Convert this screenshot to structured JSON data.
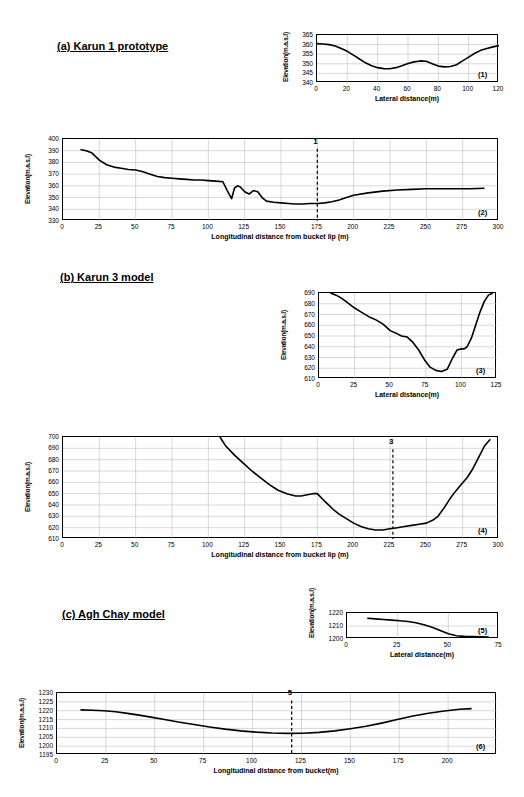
{
  "sections": [
    {
      "label": "(a) Karun 1 prototype"
    },
    {
      "label": "(b) Karun 3 model"
    },
    {
      "label": "(c) Agh Chay model"
    }
  ],
  "chart_data": [
    {
      "id": "(1)",
      "type": "line",
      "title": "",
      "xlabel": "Lateral distance(m)",
      "ylabel": "Elevation(m.a.s.l)",
      "xlim": [
        0,
        120
      ],
      "ylim": [
        340,
        365
      ],
      "xticks": [
        0,
        20,
        40,
        60,
        80,
        100,
        120
      ],
      "yticks": [
        340,
        345,
        350,
        355,
        360,
        365
      ],
      "grid": true,
      "x": [
        0,
        4,
        8,
        12,
        16,
        20,
        24,
        28,
        32,
        36,
        40,
        44,
        48,
        52,
        56,
        60,
        64,
        68,
        72,
        76,
        80,
        84,
        88,
        92,
        96,
        100,
        104,
        108,
        112,
        116,
        120
      ],
      "y": [
        360.5,
        360.3,
        360.0,
        359.3,
        358.0,
        356.5,
        354.5,
        352.5,
        350.5,
        349.0,
        348.0,
        347.5,
        347.4,
        348.0,
        349.0,
        350.2,
        351.0,
        351.5,
        351.3,
        350.0,
        348.8,
        348.4,
        348.6,
        349.5,
        351.5,
        353.5,
        355.5,
        357.0,
        358.0,
        358.8,
        359.5
      ]
    },
    {
      "id": "(2)",
      "type": "line",
      "title": "",
      "xlabel": "Longitudinal distance from bucket lip (m)",
      "ylabel": "Elevation(m.a.s.l)",
      "xlim": [
        0,
        300
      ],
      "ylim": [
        330,
        400
      ],
      "xticks": [
        0,
        25,
        50,
        75,
        100,
        125,
        150,
        175,
        200,
        225,
        250,
        275,
        300
      ],
      "yticks": [
        330,
        340,
        350,
        360,
        370,
        380,
        390,
        400
      ],
      "grid": true,
      "annotation": {
        "label": "1",
        "x": 175
      },
      "x": [
        12,
        16,
        20,
        25,
        30,
        35,
        40,
        45,
        50,
        55,
        60,
        65,
        70,
        75,
        80,
        85,
        90,
        95,
        100,
        105,
        110,
        113,
        116,
        118,
        120,
        122,
        125,
        128,
        131,
        134,
        137,
        140,
        145,
        150,
        155,
        160,
        165,
        170,
        175,
        180,
        185,
        190,
        195,
        200,
        210,
        220,
        230,
        240,
        250,
        260,
        270,
        280,
        290
      ],
      "y": [
        391,
        390,
        388,
        382,
        378,
        376,
        375,
        374,
        373.5,
        372,
        370,
        368,
        367,
        366.5,
        366,
        365.5,
        365,
        365,
        364.5,
        364,
        363.5,
        356,
        349,
        358,
        360,
        359,
        355,
        353,
        356,
        355,
        350,
        347,
        346,
        345.5,
        345,
        344.5,
        344.5,
        345,
        345,
        345.5,
        346.5,
        348,
        350,
        352,
        354,
        355.5,
        356.5,
        357,
        357.5,
        357.5,
        357.5,
        357.5,
        358
      ]
    },
    {
      "id": "(3)",
      "type": "line",
      "title": "",
      "xlabel": "Lateral distance(m)",
      "ylabel": "Elevation(m.a.s.l)",
      "xlim": [
        0,
        125
      ],
      "ylim": [
        610,
        690
      ],
      "xticks": [
        0,
        25,
        50,
        75,
        100,
        125
      ],
      "yticks": [
        610,
        620,
        630,
        640,
        650,
        660,
        670,
        680,
        690
      ],
      "grid": true,
      "x": [
        8,
        12,
        16,
        20,
        25,
        30,
        35,
        40,
        45,
        50,
        55,
        58,
        62,
        66,
        70,
        74,
        78,
        82,
        86,
        90,
        94,
        97,
        100,
        102,
        104,
        107,
        110,
        113,
        116,
        119,
        122
      ],
      "y": [
        690,
        688,
        685,
        681,
        676,
        672,
        668,
        665,
        661,
        655,
        652,
        650,
        649,
        644,
        637,
        628,
        621,
        618,
        617,
        619,
        630,
        637,
        638,
        638,
        640,
        648,
        660,
        672,
        682,
        688,
        690
      ]
    },
    {
      "id": "(4)",
      "type": "line",
      "title": "",
      "xlabel": "Longitudinal distance from bucket lip (m)",
      "ylabel": "Elevation(m.a.s.l)",
      "xlim": [
        0,
        300
      ],
      "ylim": [
        610,
        700
      ],
      "xticks": [
        0,
        25,
        50,
        75,
        100,
        125,
        150,
        175,
        200,
        225,
        250,
        275,
        300
      ],
      "yticks": [
        610,
        620,
        630,
        640,
        650,
        660,
        670,
        680,
        690,
        700
      ],
      "grid": true,
      "annotation": {
        "label": "3",
        "x": 227
      },
      "x": [
        108,
        112,
        118,
        124,
        130,
        136,
        142,
        148,
        154,
        160,
        164,
        168,
        172,
        175,
        178,
        182,
        186,
        190,
        195,
        200,
        205,
        210,
        215,
        220,
        225,
        230,
        235,
        240,
        245,
        250,
        255,
        258,
        262,
        266,
        270,
        274,
        278,
        282,
        286,
        290,
        294
      ],
      "y": [
        700,
        692,
        684,
        677,
        670,
        664,
        658,
        653,
        650,
        648,
        648,
        649,
        650,
        650,
        646,
        641,
        636,
        632,
        628,
        624,
        621,
        619,
        618,
        618,
        619,
        620,
        621,
        622,
        623,
        624,
        627,
        630,
        637,
        645,
        652,
        658,
        664,
        672,
        682,
        692,
        698
      ]
    },
    {
      "id": "(5)",
      "type": "line",
      "title": "",
      "xlabel": "Lateral distance(m)",
      "ylabel": "Elevation(m.a.s.l)",
      "xlim": [
        0,
        75
      ],
      "ylim": [
        1200,
        1220
      ],
      "xticks": [
        0,
        25,
        50,
        75
      ],
      "yticks": [
        1200,
        1210,
        1220
      ],
      "grid": true,
      "x": [
        10,
        14,
        18,
        22,
        26,
        30,
        34,
        38,
        42,
        46,
        50,
        54,
        58,
        62,
        66,
        70
      ],
      "y": [
        1216,
        1215.5,
        1215,
        1214.5,
        1214,
        1213.5,
        1212.5,
        1211,
        1209,
        1206.5,
        1204,
        1202.5,
        1202,
        1201.8,
        1201.7,
        1201.5
      ]
    },
    {
      "id": "(6)",
      "type": "line",
      "title": "",
      "xlabel": "Longitudinal distance from bucket(m)",
      "ylabel": "Elevation(m.a.s.l)",
      "xlim": [
        0,
        225
      ],
      "ylim": [
        1195,
        1230
      ],
      "xticks": [
        0,
        25,
        50,
        75,
        100,
        125,
        150,
        175,
        200
      ],
      "yticks": [
        1195,
        1200,
        1205,
        1210,
        1215,
        1220,
        1225,
        1230
      ],
      "grid": true,
      "annotation": {
        "label": "5",
        "x": 120
      },
      "x": [
        12,
        18,
        24,
        30,
        36,
        42,
        48,
        55,
        62,
        70,
        78,
        86,
        94,
        102,
        110,
        118,
        126,
        134,
        142,
        150,
        158,
        166,
        174,
        182,
        190,
        198,
        206,
        212
      ],
      "y": [
        1220.5,
        1220.3,
        1220.0,
        1219.4,
        1218.5,
        1217.5,
        1216.4,
        1215.0,
        1213.6,
        1212.2,
        1210.8,
        1209.6,
        1208.6,
        1207.9,
        1207.4,
        1207.2,
        1207.3,
        1207.8,
        1208.6,
        1209.8,
        1211.2,
        1213.0,
        1215.0,
        1217.0,
        1218.6,
        1219.8,
        1220.8,
        1221.2
      ]
    }
  ]
}
